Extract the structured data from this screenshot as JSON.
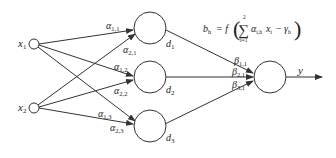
{
  "diagram": {
    "type": "neural-network",
    "line_color": "#333333",
    "inputs": [
      {
        "id": "x1",
        "label": "x",
        "sub": "1"
      },
      {
        "id": "x2",
        "label": "x",
        "sub": "2"
      }
    ],
    "hidden": [
      {
        "id": "d1",
        "label": "d",
        "sub": "1"
      },
      {
        "id": "d2",
        "label": "d",
        "sub": "2"
      },
      {
        "id": "d3",
        "label": "d",
        "sub": "3"
      }
    ],
    "output": {
      "id": "y",
      "label": "y"
    },
    "input_weights": [
      {
        "label": "α",
        "sub": "1,1"
      },
      {
        "label": "α",
        "sub": "2,1"
      },
      {
        "label": "α",
        "sub": "1,2"
      },
      {
        "label": "α",
        "sub": "2,2"
      },
      {
        "label": "α",
        "sub": "1,3"
      },
      {
        "label": "α",
        "sub": "2,3"
      }
    ],
    "output_weights": [
      {
        "label": "β",
        "sub": "1,1"
      },
      {
        "label": "β",
        "sub": "2,1"
      },
      {
        "label": "β",
        "sub": "3,1"
      }
    ],
    "formula": {
      "lhs": "b",
      "lhs_sub": "h",
      "equals": "= f",
      "sum_symbol": "∑",
      "sum_upper": "2",
      "sum_lower": "i=1",
      "term_alpha": "α",
      "term_alpha_sub": "i,h",
      "term_x": "x",
      "term_x_sub": "i",
      "minus": "−",
      "term_gamma": "γ",
      "term_gamma_sub": "h",
      "open_paren": "(",
      "close_paren": ")"
    }
  }
}
